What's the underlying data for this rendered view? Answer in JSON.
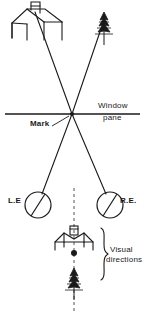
{
  "figure": {
    "stroke_color": "#1a1a1a",
    "background_color": "#ffffff"
  },
  "labels": {
    "window": "Window",
    "pane": "pane",
    "mark": "Mark",
    "left_eye": "L.E",
    "right_eye": "R.E.",
    "visual_line1": "Visual",
    "visual_line2": "directions"
  },
  "objects": {
    "house_top": "house-outline-with-chimney",
    "tree_top": "conifer-tree",
    "house_bottom": "small-house-outline-with-chimney",
    "tree_bottom": "small-conifer-tree",
    "left_eye_symbol": "eye-circle-with-axis",
    "right_eye_symbol": "eye-circle-with-axis",
    "mark_point": "crossing-mark-on-pane",
    "brace": "curly-brace-right"
  },
  "geometry": {
    "mark_x": 72,
    "mark_y": 114,
    "pane_y": 114,
    "pane_x_start": 5,
    "pane_x_end": 140,
    "left_eye": {
      "cx": 38,
      "cy": 205,
      "r": 13
    },
    "right_eye": {
      "cx": 110,
      "cy": 205,
      "r": 13
    },
    "house_top_center_x": 40,
    "tree_top_center_x": 104
  }
}
